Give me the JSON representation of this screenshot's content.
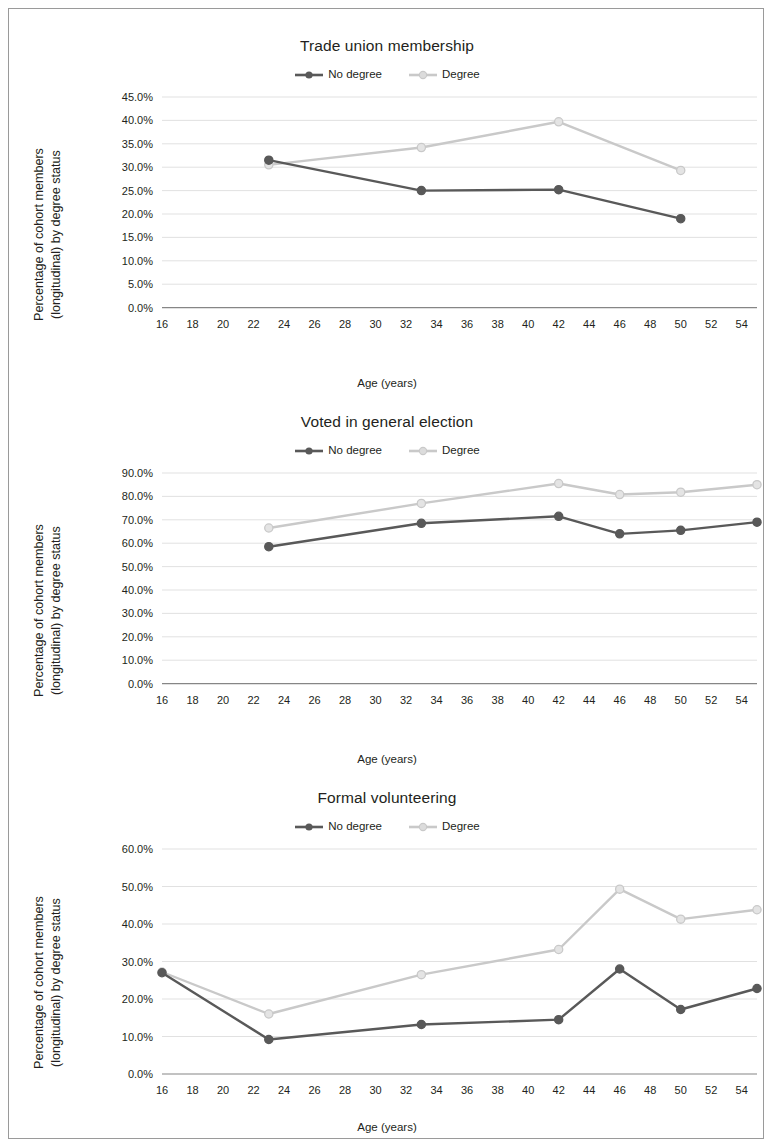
{
  "colors": {
    "no_degree": "#595959",
    "degree": "#c9c9c9",
    "grid": "#d9d9d9",
    "axis": "#868686",
    "text": "#231f20",
    "frame": "#9a9a9a"
  },
  "common": {
    "x_title": "Age (years)",
    "y_title_line1": "Percentage of cohort members",
    "y_title_line2": "(longitudinal) by degree status",
    "legend": [
      {
        "label": "No degree",
        "key": "no_degree"
      },
      {
        "label": "Degree",
        "key": "degree"
      }
    ]
  },
  "chart_data": [
    {
      "type": "line",
      "title": "Trade union membership",
      "xlabel": "Age (years)",
      "ylabel": "Percentage of cohort members (longitudinal) by degree status",
      "xlim": [
        16,
        55
      ],
      "ylim": [
        0,
        45
      ],
      "ytick_step": 5,
      "yticks": [
        "0.0%",
        "5.0%",
        "10.0%",
        "15.0%",
        "20.0%",
        "25.0%",
        "30.0%",
        "35.0%",
        "40.0%",
        "45.0%"
      ],
      "xticks": [
        16,
        18,
        20,
        22,
        24,
        26,
        28,
        30,
        32,
        34,
        36,
        38,
        40,
        42,
        44,
        46,
        48,
        50,
        52,
        54
      ],
      "grid": true,
      "legend_position": "top-center",
      "series": [
        {
          "name": "No degree",
          "color": "#595959",
          "x": [
            23,
            33,
            42,
            50
          ],
          "values": [
            31.5,
            25.0,
            25.2,
            19.0
          ]
        },
        {
          "name": "Degree",
          "color": "#c9c9c9",
          "x": [
            23,
            33,
            42,
            50
          ],
          "values": [
            30.5,
            34.2,
            39.7,
            29.3
          ]
        }
      ]
    },
    {
      "type": "line",
      "title": "Voted in general election",
      "xlabel": "Age (years)",
      "ylabel": "Percentage of cohort members (longitudinal) by degree status",
      "xlim": [
        16,
        55
      ],
      "ylim": [
        0,
        90
      ],
      "ytick_step": 10,
      "yticks": [
        "0.0%",
        "10.0%",
        "20.0%",
        "30.0%",
        "40.0%",
        "50.0%",
        "60.0%",
        "70.0%",
        "80.0%",
        "90.0%"
      ],
      "xticks": [
        16,
        18,
        20,
        22,
        24,
        26,
        28,
        30,
        32,
        34,
        36,
        38,
        40,
        42,
        44,
        46,
        48,
        50,
        52,
        54
      ],
      "grid": true,
      "legend_position": "top-center",
      "series": [
        {
          "name": "No degree",
          "color": "#595959",
          "x": [
            23,
            33,
            42,
            46,
            50,
            55
          ],
          "values": [
            58.5,
            68.5,
            71.5,
            64.0,
            65.5,
            69.0
          ]
        },
        {
          "name": "Degree",
          "color": "#c9c9c9",
          "x": [
            23,
            33,
            42,
            46,
            50,
            55
          ],
          "values": [
            66.5,
            77.0,
            85.5,
            80.8,
            81.8,
            85.0
          ]
        }
      ]
    },
    {
      "type": "line",
      "title": "Formal volunteering",
      "xlabel": "Age (years)",
      "ylabel": "Percentage of cohort members (longitudinal) by degree status",
      "xlim": [
        16,
        55
      ],
      "ylim": [
        0,
        60
      ],
      "ytick_step": 10,
      "yticks": [
        "0.0%",
        "10.0%",
        "20.0%",
        "30.0%",
        "40.0%",
        "50.0%",
        "60.0%"
      ],
      "xticks": [
        16,
        18,
        20,
        22,
        24,
        26,
        28,
        30,
        32,
        34,
        36,
        38,
        40,
        42,
        44,
        46,
        48,
        50,
        52,
        54
      ],
      "grid": true,
      "legend_position": "top-center",
      "series": [
        {
          "name": "No degree",
          "color": "#595959",
          "x": [
            16,
            23,
            33,
            42,
            46,
            50,
            55
          ],
          "values": [
            27.0,
            9.2,
            13.2,
            14.5,
            28.0,
            17.2,
            22.8
          ]
        },
        {
          "name": "Degree",
          "color": "#c9c9c9",
          "x": [
            16,
            23,
            33,
            42,
            46,
            50,
            55
          ],
          "values": [
            27.2,
            16.0,
            26.5,
            33.2,
            49.3,
            41.3,
            43.8
          ]
        }
      ]
    }
  ]
}
